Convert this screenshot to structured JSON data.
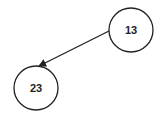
{
  "diagram": {
    "type": "tree",
    "nodes": [
      {
        "id": "n13",
        "label": "13",
        "cx": 131,
        "cy": 30,
        "r": 22
      },
      {
        "id": "n23",
        "label": "23",
        "cx": 36,
        "cy": 88,
        "r": 22
      }
    ],
    "edges": [
      {
        "from": "13",
        "to": "23",
        "directed": true
      }
    ],
    "colors": {
      "stroke": "#222222",
      "background": "#ffffff"
    }
  }
}
